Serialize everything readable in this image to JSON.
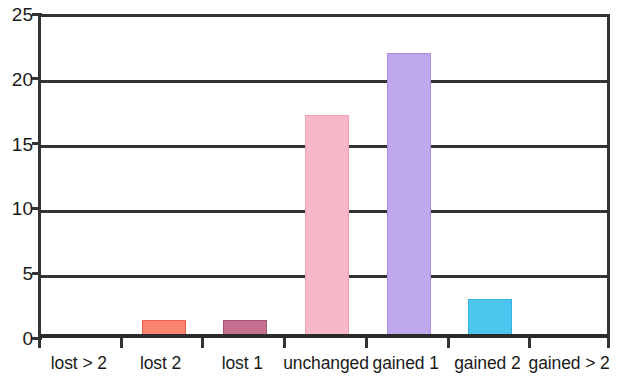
{
  "chart_data": {
    "type": "bar",
    "title": "",
    "subtitle": "",
    "xlabel": "",
    "ylabel": "",
    "categories": [
      "lost > 2",
      "lost 2",
      "lost 1",
      "unchanged",
      "gained 1",
      "gained 2",
      "gained > 2"
    ],
    "values": [
      0,
      1.05,
      1.1,
      16.9,
      21.7,
      2.7,
      0
    ],
    "ylim": [
      0,
      25
    ],
    "y_ticks": [
      0,
      5,
      10,
      15,
      20,
      25
    ],
    "y_tick_labels": [
      "0",
      "5",
      "10",
      "15",
      "20",
      "25"
    ],
    "grid": true,
    "grid_axis": "y",
    "legend": false,
    "legend_position": "none",
    "bar_colors": [
      "#ffffff",
      "#f98470",
      "#c4708f",
      "#f9b8c8",
      "#bfa8ee",
      "#4cc6ef",
      "#ffffff"
    ],
    "bar_border_colors": [
      "#ffffff",
      "#e8604c",
      "#a85276",
      "#f0a0b4",
      "#a88fe0",
      "#2fb4e2",
      "#ffffff"
    ],
    "frame_color": "#333333",
    "axis_color": "#2b2b2b",
    "background_color": "#ffffff"
  },
  "axes": {
    "y": {
      "ticks": [
        {
          "label": "25",
          "value": 25
        },
        {
          "label": "20",
          "value": 20
        },
        {
          "label": "15",
          "value": 15
        },
        {
          "label": "10",
          "value": 10
        },
        {
          "label": "5",
          "value": 5
        },
        {
          "label": "0",
          "value": 0
        }
      ]
    },
    "x": {
      "ticks": [
        {
          "label": "lost > 2"
        },
        {
          "label": "lost 2"
        },
        {
          "label": "lost 1"
        },
        {
          "label": "unchanged"
        },
        {
          "label": "gained 1"
        },
        {
          "label": "gained 2"
        },
        {
          "label": "gained > 2"
        }
      ]
    }
  }
}
